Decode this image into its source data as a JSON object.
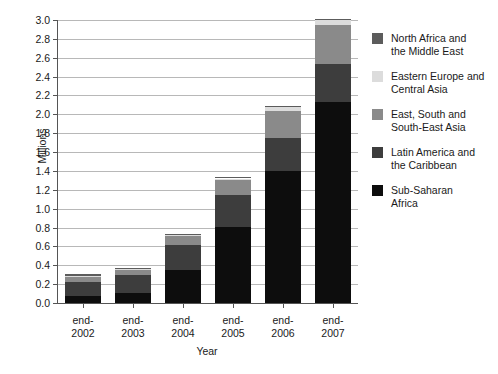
{
  "chart_data": {
    "type": "bar",
    "subtype": "stacked-bar",
    "title": "",
    "xlabel": "Year",
    "ylabel": "Millions",
    "ylim": [
      0,
      3.0
    ],
    "ytick_step": 0.2,
    "grid": true,
    "legend_position": "right",
    "categories": [
      "end-\n2002",
      "end-\n2003",
      "end-\n2004",
      "end-\n2005",
      "end-\n2006",
      "end-\n2007"
    ],
    "category_lines": [
      [
        "end-",
        "2002"
      ],
      [
        "end-",
        "2003"
      ],
      [
        "end-",
        "2004"
      ],
      [
        "end-",
        "2005"
      ],
      [
        "end-",
        "2006"
      ],
      [
        "end-",
        "2007"
      ]
    ],
    "ytick_labels": [
      "0.0",
      "0.2",
      "0.4",
      "0.6",
      "0.8",
      "1.0",
      "1.2",
      "1.4",
      "1.6",
      "1.8",
      "2.0",
      "2.2",
      "2.4",
      "2.6",
      "2.8",
      "3.0"
    ],
    "ytick_values": [
      0.0,
      0.2,
      0.4,
      0.6,
      0.8,
      1.0,
      1.2,
      1.4,
      1.6,
      1.8,
      2.0,
      2.2,
      2.4,
      2.6,
      2.8,
      3.0
    ],
    "stack_order_bottom_to_top": [
      "Sub-Saharan Africa",
      "Latin America and the Caribbean",
      "East, South and South-East Asia",
      "Eastern Europe and Central Asia",
      "North Africa and the Middle East"
    ],
    "series": [
      {
        "name": "Sub-Saharan Africa",
        "color": "#0d0d0d",
        "legend_lines": [
          "Sub-Saharan",
          "Africa"
        ],
        "values": [
          0.07,
          0.11,
          0.35,
          0.81,
          1.4,
          2.13
        ]
      },
      {
        "name": "Latin America and the Caribbean",
        "color": "#3d3d3d",
        "legend_lines": [
          "Latin America and",
          "the Caribbean"
        ],
        "values": [
          0.15,
          0.19,
          0.27,
          0.33,
          0.35,
          0.4
        ]
      },
      {
        "name": "East, South and South-East Asia",
        "color": "#8a8a8a",
        "legend_lines": [
          "East, South and",
          "South-East Asia"
        ],
        "values": [
          0.06,
          0.05,
          0.09,
          0.16,
          0.29,
          0.42
        ]
      },
      {
        "name": "Eastern Europe and Central Asia",
        "color": "#dcdcdc",
        "legend_lines": [
          "Eastern Europe and",
          "Central Asia"
        ],
        "values": [
          0.01,
          0.01,
          0.01,
          0.02,
          0.04,
          0.05
        ]
      },
      {
        "name": "North Africa and the Middle East",
        "color": "#5c5c5c",
        "legend_lines": [
          "North Africa and",
          "the Middle East"
        ],
        "values": [
          0.005,
          0.005,
          0.005,
          0.01,
          0.01,
          0.01
        ]
      }
    ],
    "totals": [
      0.295,
      0.365,
      0.725,
      1.33,
      2.09,
      3.01
    ],
    "legend_order_top_to_bottom": [
      "North Africa and the Middle East",
      "Eastern Europe and Central Asia",
      "East, South and South-East Asia",
      "Latin America and the Caribbean",
      "Sub-Saharan Africa"
    ]
  },
  "colors": {
    "axis": "#555555",
    "grid": "#b8b8b8",
    "background": "#ffffff",
    "text": "#1a1a1a"
  }
}
